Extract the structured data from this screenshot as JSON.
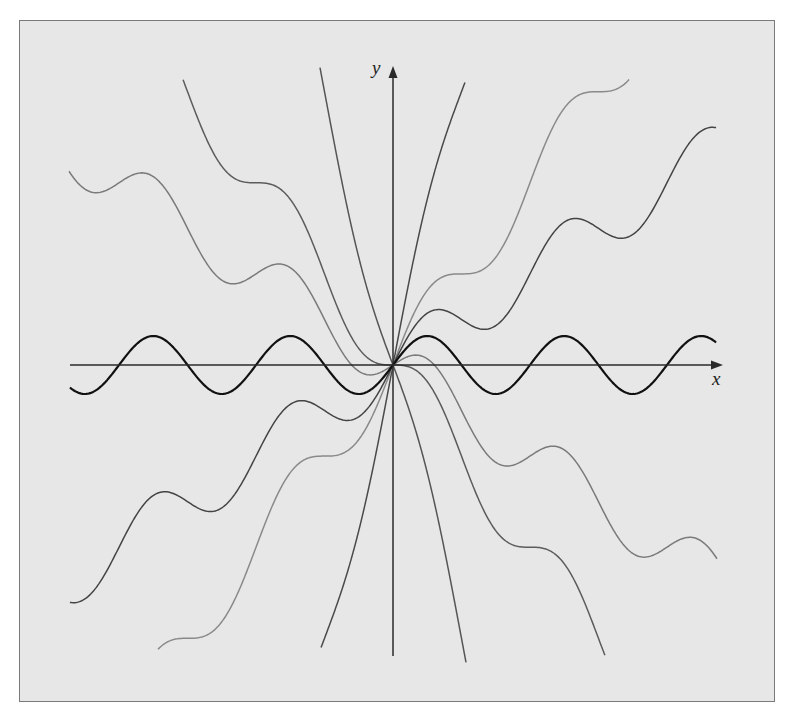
{
  "chart_data": {
    "type": "line",
    "title": "",
    "xlabel": "x",
    "ylabel": "y",
    "grid": false,
    "legend": null,
    "function_family": "y = sin(x) + c*x",
    "axes": {
      "origin_px": [
        393,
        365
      ],
      "x_unit_px": 21.8,
      "y_unit_px": 29,
      "x_axis_px": {
        "x1": 70,
        "x2": 723
      },
      "y_axis_px": {
        "y1": 656,
        "y2": 66
      }
    },
    "series": [
      {
        "name": "c = 0 (y = sin x)",
        "c": 0,
        "x_range": [
          -14.82,
          14.82
        ],
        "color": "#111111",
        "width": 2.2
      },
      {
        "name": "c = 0.5",
        "c": 0.5,
        "x_range": [
          -14.82,
          14.82
        ],
        "color": "#444444",
        "width": 1.5
      },
      {
        "name": "c = -0.5",
        "c": -0.5,
        "x_range": [
          -14.86,
          14.86
        ],
        "color": "#7a7a7a",
        "width": 1.5
      },
      {
        "name": "c = 1",
        "c": 1,
        "x_range": [
          -10.78,
          10.83
        ],
        "color": "#8a8a8a",
        "width": 1.5
      },
      {
        "name": "c = -1",
        "c": -1,
        "x_range": [
          -9.63,
          9.72
        ],
        "color": "#5c5c5c",
        "width": 1.5
      },
      {
        "name": "c = 3",
        "c": 3,
        "x_range": [
          -3.3,
          3.3
        ],
        "color": "#4a4a4a",
        "width": 1.5
      },
      {
        "name": "c = -3",
        "c": -3,
        "x_range": [
          -3.35,
          3.35
        ],
        "color": "#555555",
        "width": 1.5
      }
    ],
    "annotations": []
  },
  "labels": {
    "x_axis": "x",
    "y_axis": "y"
  },
  "colors": {
    "background": "#e7e7e7",
    "frame_border": "#7a7a7a",
    "axis": "#2a2a2a"
  }
}
